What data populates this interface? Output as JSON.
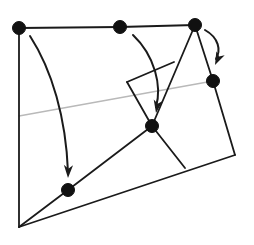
{
  "figure": {
    "canvas": {
      "width": 254,
      "height": 245,
      "background": "#ffffff"
    },
    "colors": {
      "outline": "#1a1a1a",
      "vertex": "#111111",
      "arrow": "#1a1a1a",
      "guide_line": "#b9b9b9",
      "background": "#ffffff"
    },
    "stroke_widths": {
      "outline": 1.8,
      "inner": 1.7,
      "guide": 1.4,
      "arrow": 2.0
    }
  },
  "chart_data": {
    "type": "diagram",
    "title": "",
    "xlabel": "",
    "ylabel": "",
    "xlim": [
      0,
      254
    ],
    "ylim": [
      0,
      245
    ],
    "grid": false,
    "legend": "none",
    "points": [
      {
        "name": "top-left-vertex",
        "x": 19,
        "y": 28,
        "marked": true
      },
      {
        "name": "top-middle-vertex",
        "x": 120,
        "y": 27,
        "marked": true
      },
      {
        "name": "top-right-vertex",
        "x": 195,
        "y": 25,
        "marked": true
      },
      {
        "name": "right-edge-vertex",
        "x": 213,
        "y": 81,
        "marked": true
      },
      {
        "name": "center-vertex",
        "x": 152,
        "y": 126,
        "marked": true
      },
      {
        "name": "lower-left-diagonal-vertex",
        "x": 68,
        "y": 190,
        "marked": true
      },
      {
        "name": "bottom-left-corner",
        "x": 19,
        "y": 227,
        "marked": false
      },
      {
        "name": "bottom-right-corner",
        "x": 235,
        "y": 155,
        "marked": false
      },
      {
        "name": "inner-quad-top-corner",
        "x": 127,
        "y": 82,
        "marked": false
      },
      {
        "name": "inner-quad-bottom-corner",
        "x": 185,
        "y": 168,
        "marked": false
      }
    ],
    "polylines": [
      {
        "name": "outer-top-edge",
        "points": "19,28 120,27 195,25",
        "color": "#1a1a1a"
      },
      {
        "name": "outer-left-edge",
        "points": "19,28 19,227",
        "color": "#1a1a1a"
      },
      {
        "name": "outer-right-edge",
        "points": "195,25 213,81 235,155",
        "color": "#1a1a1a"
      },
      {
        "name": "outer-bottom-edge",
        "points": "19,227 235,155",
        "color": "#1a1a1a"
      },
      {
        "name": "lower-diagonal-edge",
        "points": "19,227 68,190 152,126",
        "color": "#1a1a1a"
      },
      {
        "name": "top-right-to-center-edge",
        "points": "195,25 152,126",
        "color": "#1a1a1a"
      },
      {
        "name": "inner-quad-left-edge",
        "points": "127,82 152,126",
        "color": "#1a1a1a"
      },
      {
        "name": "inner-quad-top-edge",
        "points": "127,82 174,62",
        "color": "#1a1a1a"
      },
      {
        "name": "inner-quad-right-edge",
        "points": "152,126 185,168",
        "color": "#1a1a1a"
      },
      {
        "name": "guide-transversal-line",
        "points": "19,116 213,81",
        "color": "#b9b9b9"
      }
    ],
    "arrows": [
      {
        "name": "left-vertex-motion-arrow",
        "path": "M 30,36 C 52,70 66,118 68,172",
        "head_at": [
          68,
          178
        ],
        "head_angle_deg": 92
      },
      {
        "name": "middle-vertex-motion-arrow",
        "path": "M 133,35 C 155,56 162,86 156,107",
        "head_at": [
          156,
          113
        ],
        "head_angle_deg": 100
      },
      {
        "name": "right-vertex-motion-arrow",
        "path": "M 205,30 C 219,38 221,50 216,59",
        "head_at": [
          215,
          65
        ],
        "head_angle_deg": 115
      }
    ],
    "vertex_dot_radius": 6.5
  }
}
